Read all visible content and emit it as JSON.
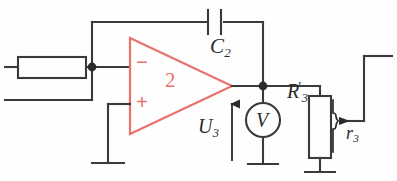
{
  "diagram": {
    "background_color": "#fefefe",
    "wire_color": "#3a3a3a",
    "accent_color": "#e8736a",
    "label_color": "#2b2b2b"
  },
  "labels": {
    "capacitor_c2": "C",
    "capacitor_c2_sub": "2",
    "output_voltage": "U",
    "output_voltage_sub": "3",
    "resistor_r3_prime": "R",
    "resistor_r3_prime_sub": "3",
    "resistor_r3_prime_mark": "′",
    "wiper_r3": "r",
    "wiper_r3_sub": "3",
    "opamp_number": "2",
    "opamp_inverting": "−",
    "opamp_noninverting": "+",
    "voltmeter": "V"
  },
  "components": {
    "input_resistor": {
      "name": "input-resistor",
      "label": "",
      "orientation": "horizontal"
    },
    "feedback_capacitor": {
      "name": "feedback-capacitor",
      "label": "C2",
      "orientation": "vertical-plates"
    },
    "opamp": {
      "name": "operational-amplifier",
      "designator": "2",
      "inverting_input": "−",
      "noninverting_input": "+"
    },
    "voltmeter": {
      "name": "voltmeter",
      "symbol": "V"
    },
    "potentiometer": {
      "name": "potentiometer-r3",
      "body_label": "R3'",
      "wiper_label": "r3"
    },
    "grounds": [
      {
        "name": "ground-noninverting-input"
      },
      {
        "name": "ground-voltmeter"
      },
      {
        "name": "ground-potentiometer"
      }
    ],
    "junctions": [
      {
        "name": "junction-inverting-node"
      },
      {
        "name": "junction-output-node"
      }
    ],
    "arrows": [
      {
        "name": "arrow-output-voltage",
        "direction": "up",
        "label": "U3"
      },
      {
        "name": "arrow-wiper",
        "direction": "left"
      }
    ]
  }
}
